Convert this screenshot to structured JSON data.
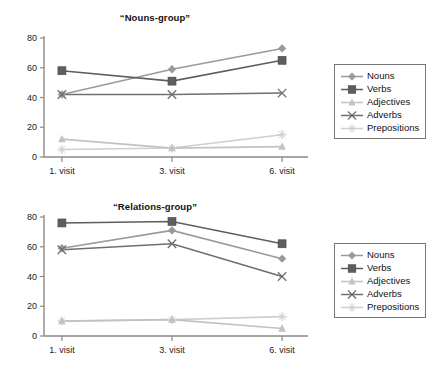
{
  "charts": [
    {
      "title": "“Nouns-group”",
      "legend_position": "right"
    },
    {
      "title": "“Relations-group”",
      "legend_position": "right"
    }
  ],
  "legend": {
    "items": [
      {
        "label": "Nouns",
        "marker": "diamond",
        "color": "#9a9a9a"
      },
      {
        "label": "Verbs",
        "marker": "square",
        "color": "#5e5e5e"
      },
      {
        "label": "Adjectives",
        "marker": "triangle",
        "color": "#c2c2c2"
      },
      {
        "label": "Adverbs",
        "marker": "cross-x",
        "color": "#6f6f6f"
      },
      {
        "label": "Prepositions",
        "marker": "star-plus",
        "color": "#cfcfcf"
      }
    ]
  },
  "axis": {
    "y_ticks": [
      "0",
      "20",
      "40",
      "60",
      "80"
    ],
    "x_ticks": [
      "1. visit",
      "3. visit",
      "6. visit"
    ]
  },
  "chart_data": [
    {
      "type": "line",
      "title": "“Nouns-group”",
      "xlabel": "",
      "ylabel": "",
      "categories": [
        "1. visit",
        "3. visit",
        "6. visit"
      ],
      "ylim": [
        0,
        80
      ],
      "yticks": [
        0,
        20,
        40,
        60,
        80
      ],
      "grid": false,
      "legend": "right",
      "series": [
        {
          "name": "Nouns",
          "marker": "diamond",
          "color": "#9a9a9a",
          "values": [
            42,
            59,
            73
          ]
        },
        {
          "name": "Verbs",
          "marker": "square",
          "color": "#5e5e5e",
          "values": [
            58,
            51,
            65
          ]
        },
        {
          "name": "Adjectives",
          "marker": "triangle",
          "color": "#c2c2c2",
          "values": [
            12,
            6,
            7
          ]
        },
        {
          "name": "Adverbs",
          "marker": "cross-x",
          "color": "#6f6f6f",
          "values": [
            42,
            42,
            43
          ]
        },
        {
          "name": "Prepositions",
          "marker": "star-plus",
          "color": "#cfcfcf",
          "values": [
            5,
            6,
            15
          ]
        }
      ]
    },
    {
      "type": "line",
      "title": "“Relations-group”",
      "xlabel": "",
      "ylabel": "",
      "categories": [
        "1. visit",
        "3. visit",
        "6. visit"
      ],
      "ylim": [
        0,
        80
      ],
      "yticks": [
        0,
        20,
        40,
        60,
        80
      ],
      "grid": false,
      "legend": "right",
      "series": [
        {
          "name": "Nouns",
          "marker": "diamond",
          "color": "#9a9a9a",
          "values": [
            59,
            71,
            52
          ]
        },
        {
          "name": "Verbs",
          "marker": "square",
          "color": "#5e5e5e",
          "values": [
            76,
            77,
            62
          ]
        },
        {
          "name": "Adjectives",
          "marker": "triangle",
          "color": "#c2c2c2",
          "values": [
            10,
            11,
            5
          ]
        },
        {
          "name": "Adverbs",
          "marker": "cross-x",
          "color": "#6f6f6f",
          "values": [
            58,
            62,
            40
          ]
        },
        {
          "name": "Prepositions",
          "marker": "star-plus",
          "color": "#cfcfcf",
          "values": [
            10,
            11,
            13
          ]
        }
      ]
    }
  ]
}
